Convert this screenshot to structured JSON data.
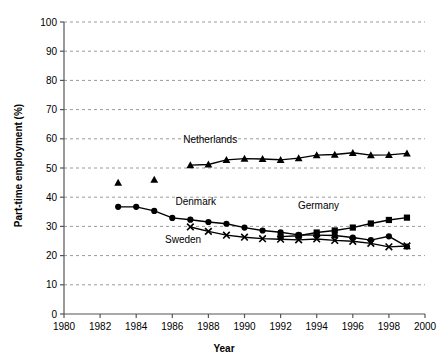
{
  "chart_data": {
    "type": "line",
    "title": "",
    "xlabel": "Year",
    "ylabel": "Part-time employment (%)",
    "xlim": [
      1980,
      2000
    ],
    "ylim": [
      0,
      100
    ],
    "xticks": [
      1980,
      1982,
      1984,
      1986,
      1988,
      1990,
      1992,
      1994,
      1996,
      1998,
      2000
    ],
    "yticks": [
      0,
      10,
      20,
      30,
      40,
      50,
      60,
      70,
      80,
      90,
      100
    ],
    "grid": "horizontal-dashed",
    "legend": "inline-annotations",
    "series": [
      {
        "name": "Netherlands",
        "marker": "triangle",
        "label_x": 1988.1,
        "label_y": 58.5,
        "points": [
          {
            "x": 1983,
            "y": 45.0,
            "connected": false
          },
          {
            "x": 1985,
            "y": 46.0,
            "connected": false
          },
          {
            "x": 1987,
            "y": 51.0,
            "connected": true
          },
          {
            "x": 1988,
            "y": 51.2,
            "connected": true
          },
          {
            "x": 1989,
            "y": 52.8,
            "connected": true
          },
          {
            "x": 1990,
            "y": 53.2,
            "connected": true
          },
          {
            "x": 1991,
            "y": 53.1,
            "connected": true
          },
          {
            "x": 1992,
            "y": 52.8,
            "connected": true
          },
          {
            "x": 1993,
            "y": 53.4,
            "connected": true
          },
          {
            "x": 1994,
            "y": 54.4,
            "connected": true
          },
          {
            "x": 1995,
            "y": 54.6,
            "connected": true
          },
          {
            "x": 1996,
            "y": 55.2,
            "connected": true
          },
          {
            "x": 1997,
            "y": 54.4,
            "connected": true
          },
          {
            "x": 1998,
            "y": 54.5,
            "connected": true
          },
          {
            "x": 1999,
            "y": 55.0,
            "connected": true
          }
        ]
      },
      {
        "name": "Denmark",
        "marker": "circle",
        "label_x": 1987.3,
        "label_y": 37.5,
        "points": [
          {
            "x": 1983,
            "y": 36.7,
            "connected": true
          },
          {
            "x": 1984,
            "y": 36.7,
            "connected": true
          },
          {
            "x": 1985,
            "y": 35.3,
            "connected": true
          },
          {
            "x": 1986,
            "y": 32.9,
            "connected": true
          },
          {
            "x": 1987,
            "y": 32.3,
            "connected": true
          },
          {
            "x": 1988,
            "y": 31.5,
            "connected": true
          },
          {
            "x": 1989,
            "y": 30.9,
            "connected": true
          },
          {
            "x": 1990,
            "y": 29.6,
            "connected": true
          },
          {
            "x": 1991,
            "y": 28.6,
            "connected": true
          },
          {
            "x": 1992,
            "y": 28.0,
            "connected": true
          },
          {
            "x": 1993,
            "y": 27.1,
            "connected": true
          },
          {
            "x": 1994,
            "y": 27.0,
            "connected": true
          },
          {
            "x": 1995,
            "y": 26.9,
            "connected": true
          },
          {
            "x": 1996,
            "y": 26.2,
            "connected": true
          },
          {
            "x": 1997,
            "y": 25.3,
            "connected": true
          },
          {
            "x": 1998,
            "y": 26.6,
            "connected": true
          },
          {
            "x": 1999,
            "y": 23.1,
            "connected": true
          }
        ]
      },
      {
        "name": "Sweden",
        "marker": "cross",
        "label_x": 1986.6,
        "label_y": 24.2,
        "points": [
          {
            "x": 1987,
            "y": 29.8,
            "connected": true
          },
          {
            "x": 1988,
            "y": 28.3,
            "connected": true
          },
          {
            "x": 1989,
            "y": 27.0,
            "connected": true
          },
          {
            "x": 1990,
            "y": 26.3,
            "connected": true
          },
          {
            "x": 1991,
            "y": 25.8,
            "connected": true
          },
          {
            "x": 1992,
            "y": 25.6,
            "connected": true
          },
          {
            "x": 1993,
            "y": 25.4,
            "connected": true
          },
          {
            "x": 1994,
            "y": 25.7,
            "connected": true
          },
          {
            "x": 1995,
            "y": 25.2,
            "connected": true
          },
          {
            "x": 1996,
            "y": 24.9,
            "connected": true
          },
          {
            "x": 1997,
            "y": 24.2,
            "connected": true
          },
          {
            "x": 1998,
            "y": 23.0,
            "connected": true
          },
          {
            "x": 1999,
            "y": 23.3,
            "connected": true
          }
        ]
      },
      {
        "name": "Germany",
        "marker": "square",
        "label_x": 1994.1,
        "label_y": 35.8,
        "points": [
          {
            "x": 1992,
            "y": 26.5,
            "connected": true
          },
          {
            "x": 1993,
            "y": 26.8,
            "connected": true
          },
          {
            "x": 1994,
            "y": 27.9,
            "connected": true
          },
          {
            "x": 1995,
            "y": 28.6,
            "connected": true
          },
          {
            "x": 1996,
            "y": 29.6,
            "connected": true
          },
          {
            "x": 1997,
            "y": 31.0,
            "connected": true
          },
          {
            "x": 1998,
            "y": 32.2,
            "connected": true
          },
          {
            "x": 1999,
            "y": 33.0,
            "connected": true
          }
        ]
      }
    ]
  }
}
